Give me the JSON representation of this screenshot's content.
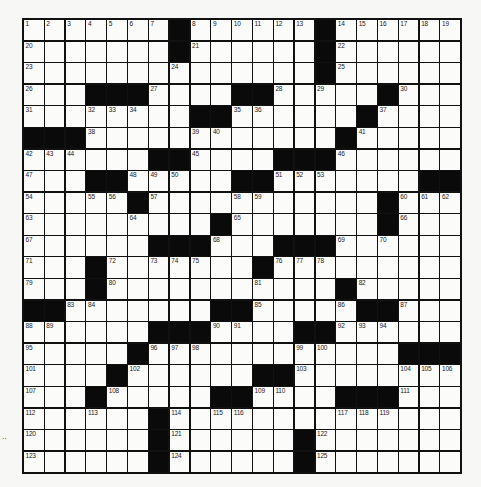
{
  "puzzle": {
    "rows": 21,
    "cols": 21,
    "colors": {
      "grid_line": "#111111",
      "block": "#0a0a0a",
      "cell": "#fbfbfa",
      "background": "#f7f7f5"
    },
    "blocks": [
      [
        0,
        7
      ],
      [
        0,
        14
      ],
      [
        1,
        7
      ],
      [
        1,
        14
      ],
      [
        2,
        14
      ],
      [
        3,
        3
      ],
      [
        3,
        4
      ],
      [
        3,
        5
      ],
      [
        3,
        10
      ],
      [
        3,
        11
      ],
      [
        3,
        17
      ],
      [
        4,
        8
      ],
      [
        4,
        9
      ],
      [
        4,
        16
      ],
      [
        5,
        0
      ],
      [
        5,
        1
      ],
      [
        5,
        2
      ],
      [
        5,
        15
      ],
      [
        6,
        6
      ],
      [
        6,
        7
      ],
      [
        6,
        12
      ],
      [
        6,
        13
      ],
      [
        6,
        14
      ],
      [
        7,
        3
      ],
      [
        7,
        4
      ],
      [
        7,
        10
      ],
      [
        7,
        11
      ],
      [
        7,
        19
      ],
      [
        7,
        20
      ],
      [
        8,
        5
      ],
      [
        8,
        17
      ],
      [
        9,
        9
      ],
      [
        9,
        17
      ],
      [
        10,
        6
      ],
      [
        10,
        7
      ],
      [
        10,
        8
      ],
      [
        10,
        12
      ],
      [
        10,
        13
      ],
      [
        10,
        14
      ],
      [
        11,
        3
      ],
      [
        11,
        11
      ],
      [
        12,
        3
      ],
      [
        12,
        15
      ],
      [
        13,
        0
      ],
      [
        13,
        1
      ],
      [
        13,
        9
      ],
      [
        13,
        10
      ],
      [
        13,
        16
      ],
      [
        13,
        17
      ],
      [
        14,
        6
      ],
      [
        14,
        7
      ],
      [
        14,
        8
      ],
      [
        14,
        13
      ],
      [
        14,
        14
      ],
      [
        15,
        5
      ],
      [
        15,
        18
      ],
      [
        15,
        19
      ],
      [
        15,
        20
      ],
      [
        16,
        4
      ],
      [
        16,
        11
      ],
      [
        16,
        12
      ],
      [
        17,
        3
      ],
      [
        17,
        9
      ],
      [
        17,
        10
      ],
      [
        17,
        15
      ],
      [
        17,
        16
      ],
      [
        17,
        17
      ],
      [
        18,
        6
      ],
      [
        19,
        6
      ],
      [
        19,
        13
      ],
      [
        20,
        6
      ],
      [
        20,
        13
      ]
    ],
    "numbers": [
      [
        0,
        0,
        "1"
      ],
      [
        0,
        1,
        "2"
      ],
      [
        0,
        2,
        "3"
      ],
      [
        0,
        3,
        "4"
      ],
      [
        0,
        4,
        "5"
      ],
      [
        0,
        5,
        "6"
      ],
      [
        0,
        6,
        "7"
      ],
      [
        0,
        8,
        "8"
      ],
      [
        0,
        9,
        "9"
      ],
      [
        0,
        10,
        "10"
      ],
      [
        0,
        11,
        "11"
      ],
      [
        0,
        12,
        "12"
      ],
      [
        0,
        13,
        "13"
      ],
      [
        0,
        15,
        "14"
      ],
      [
        0,
        16,
        "15"
      ],
      [
        0,
        17,
        "16"
      ],
      [
        0,
        18,
        "17"
      ],
      [
        0,
        19,
        "18"
      ],
      [
        0,
        20,
        "19"
      ],
      [
        1,
        0,
        "20"
      ],
      [
        1,
        8,
        "21"
      ],
      [
        1,
        15,
        "22"
      ],
      [
        2,
        0,
        "23"
      ],
      [
        2,
        7,
        "24"
      ],
      [
        2,
        15,
        "25"
      ],
      [
        3,
        0,
        "26"
      ],
      [
        3,
        6,
        "27"
      ],
      [
        3,
        12,
        "28"
      ],
      [
        3,
        14,
        "29"
      ],
      [
        3,
        18,
        "30"
      ],
      [
        4,
        0,
        "31"
      ],
      [
        4,
        3,
        "32"
      ],
      [
        4,
        4,
        "33"
      ],
      [
        4,
        5,
        "34"
      ],
      [
        4,
        10,
        "35"
      ],
      [
        4,
        11,
        "36"
      ],
      [
        4,
        17,
        "37"
      ],
      [
        5,
        3,
        "38"
      ],
      [
        5,
        8,
        "39"
      ],
      [
        5,
        9,
        "40"
      ],
      [
        5,
        16,
        "41"
      ],
      [
        6,
        0,
        "42"
      ],
      [
        6,
        1,
        "43"
      ],
      [
        6,
        2,
        "44"
      ],
      [
        6,
        8,
        "45"
      ],
      [
        6,
        15,
        "46"
      ],
      [
        7,
        0,
        "47"
      ],
      [
        7,
        5,
        "48"
      ],
      [
        7,
        6,
        "49"
      ],
      [
        7,
        7,
        "50"
      ],
      [
        7,
        12,
        "51"
      ],
      [
        7,
        13,
        "52"
      ],
      [
        7,
        14,
        "53"
      ],
      [
        8,
        0,
        "54"
      ],
      [
        8,
        3,
        "55"
      ],
      [
        8,
        4,
        "56"
      ],
      [
        8,
        6,
        "57"
      ],
      [
        8,
        10,
        "58"
      ],
      [
        8,
        11,
        "59"
      ],
      [
        8,
        18,
        "60"
      ],
      [
        8,
        19,
        "61"
      ],
      [
        8,
        20,
        "62"
      ],
      [
        9,
        0,
        "63"
      ],
      [
        9,
        5,
        "64"
      ],
      [
        9,
        10,
        "65"
      ],
      [
        9,
        18,
        "66"
      ],
      [
        10,
        0,
        "67"
      ],
      [
        10,
        9,
        "68"
      ],
      [
        10,
        15,
        "69"
      ],
      [
        10,
        17,
        "70"
      ],
      [
        11,
        0,
        "71"
      ],
      [
        11,
        4,
        "72"
      ],
      [
        11,
        6,
        "73"
      ],
      [
        11,
        7,
        "74"
      ],
      [
        11,
        8,
        "75"
      ],
      [
        11,
        12,
        "76"
      ],
      [
        11,
        13,
        "77"
      ],
      [
        11,
        14,
        "78"
      ],
      [
        12,
        0,
        "79"
      ],
      [
        12,
        4,
        "80"
      ],
      [
        12,
        11,
        "81"
      ],
      [
        12,
        16,
        "82"
      ],
      [
        13,
        2,
        "83"
      ],
      [
        13,
        3,
        "84"
      ],
      [
        13,
        11,
        "85"
      ],
      [
        13,
        15,
        "86"
      ],
      [
        13,
        18,
        "87"
      ],
      [
        14,
        0,
        "88"
      ],
      [
        14,
        1,
        "89"
      ],
      [
        14,
        9,
        "90"
      ],
      [
        14,
        10,
        "91"
      ],
      [
        14,
        15,
        "92"
      ],
      [
        14,
        16,
        "93"
      ],
      [
        14,
        17,
        "94"
      ],
      [
        15,
        0,
        "95"
      ],
      [
        15,
        6,
        "96"
      ],
      [
        15,
        7,
        "97"
      ],
      [
        15,
        8,
        "98"
      ],
      [
        15,
        13,
        "99"
      ],
      [
        15,
        14,
        "100"
      ],
      [
        16,
        0,
        "101"
      ],
      [
        16,
        5,
        "102"
      ],
      [
        16,
        13,
        "103"
      ],
      [
        16,
        18,
        "104"
      ],
      [
        16,
        19,
        "105"
      ],
      [
        16,
        20,
        "106"
      ],
      [
        17,
        0,
        "107"
      ],
      [
        17,
        4,
        "108"
      ],
      [
        17,
        11,
        "109"
      ],
      [
        17,
        12,
        "110"
      ],
      [
        17,
        18,
        "111"
      ],
      [
        18,
        0,
        "112"
      ],
      [
        18,
        3,
        "113"
      ],
      [
        18,
        7,
        "114"
      ],
      [
        18,
        9,
        "115"
      ],
      [
        18,
        10,
        "116"
      ],
      [
        18,
        15,
        "117"
      ],
      [
        18,
        16,
        "118"
      ],
      [
        18,
        17,
        "119"
      ],
      [
        19,
        0,
        "120"
      ],
      [
        19,
        7,
        "121"
      ],
      [
        19,
        14,
        "122"
      ],
      [
        20,
        0,
        "123"
      ],
      [
        20,
        7,
        "124"
      ],
      [
        20,
        14,
        "125"
      ]
    ]
  },
  "margin_mark": "‥"
}
